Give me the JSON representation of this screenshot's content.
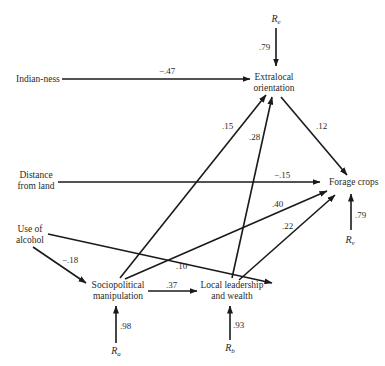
{
  "diagram": {
    "type": "path-diagram",
    "nodes": {
      "indianness": {
        "lines": [
          "Indian-ness"
        ]
      },
      "extralocal": {
        "lines": [
          "Extralocal",
          "orientation"
        ]
      },
      "distance": {
        "lines": [
          "Distance",
          "from land"
        ]
      },
      "forage": {
        "lines": [
          "Forage crops"
        ]
      },
      "alcohol": {
        "lines": [
          "Use of",
          "alcohol"
        ]
      },
      "sociopolitical": {
        "lines": [
          "Sociopolitical",
          "manipulation"
        ]
      },
      "leadership": {
        "lines": [
          "Local leadership",
          "and wealth"
        ]
      }
    },
    "residuals": {
      "re": {
        "base": "R",
        "sub": "e",
        "coef": ".79",
        "target": "Extralocal orientation"
      },
      "rv": {
        "base": "R",
        "sub": "v",
        "coef": ".79",
        "target": "Forage crops"
      },
      "ra": {
        "base": "R",
        "sub": "a",
        "coef": ".98",
        "target": "Sociopolitical manipulation"
      },
      "rb": {
        "base": "R",
        "sub": "b",
        "coef": ".93",
        "target": "Local leadership and wealth"
      }
    },
    "edges": [
      {
        "id": "indianness_extralocal",
        "from": "Indian-ness",
        "to": "Extralocal orientation",
        "coef": "−.47"
      },
      {
        "id": "socio_extralocal",
        "from": "Sociopolitical manipulation",
        "to": "Extralocal orientation",
        "coef": ".15"
      },
      {
        "id": "leadership_extralocal",
        "from": "Local leadership and wealth",
        "to": "Extralocal orientation",
        "coef": ".28"
      },
      {
        "id": "extralocal_forage",
        "from": "Extralocal orientation",
        "to": "Forage crops",
        "coef": ".12"
      },
      {
        "id": "distance_forage",
        "from": "Distance from land",
        "to": "Forage crops",
        "coef": "−.15"
      },
      {
        "id": "socio_forage",
        "from": "Sociopolitical manipulation",
        "to": "Forage crops",
        "coef": ".40"
      },
      {
        "id": "leadership_forage",
        "from": "Local leadership and wealth",
        "to": "Forage crops",
        "coef": ".22"
      },
      {
        "id": "alcohol_socio",
        "from": "Use of alcohol",
        "to": "Sociopolitical manipulation",
        "coef": "−.18"
      },
      {
        "id": "alcohol_leadership",
        "from": "Use of alcohol",
        "to": "Local leadership and wealth",
        "coef": ".10"
      },
      {
        "id": "socio_leadership",
        "from": "Sociopolitical manipulation",
        "to": "Local leadership and wealth",
        "coef": ".37"
      }
    ]
  }
}
